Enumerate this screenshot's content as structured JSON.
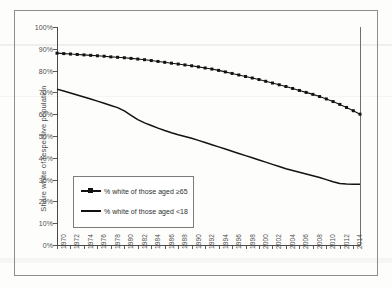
{
  "chart_data": {
    "type": "line",
    "title": "",
    "xlabel": "",
    "ylabel": "Share white of respective population",
    "ylim": [
      0,
      100
    ],
    "xlim": [
      1970,
      2015
    ],
    "y_tick_labels": [
      "0%",
      "10%",
      "20%",
      "30%",
      "40%",
      "50%",
      "60%",
      "70%",
      "80%",
      "90%",
      "100%"
    ],
    "y_tick_values": [
      0,
      10,
      20,
      30,
      40,
      50,
      60,
      70,
      80,
      90,
      100
    ],
    "x_tick_labels": [
      "1970",
      "1972",
      "1974",
      "1976",
      "1978",
      "1980",
      "1982",
      "1984",
      "1986",
      "1988",
      "1990",
      "1992",
      "1994",
      "1996",
      "1998",
      "2000",
      "2002",
      "2004",
      "2006",
      "2008",
      "2010",
      "2012",
      "2014"
    ],
    "x_tick_values": [
      1970,
      1972,
      1974,
      1976,
      1978,
      1980,
      1982,
      1984,
      1986,
      1988,
      1990,
      1992,
      1994,
      1996,
      1998,
      2000,
      2002,
      2004,
      2006,
      2008,
      2010,
      2012,
      2014
    ],
    "grid": false,
    "legend_position": "inside lower-left",
    "x": [
      1970,
      1971,
      1972,
      1973,
      1974,
      1975,
      1976,
      1977,
      1978,
      1979,
      1980,
      1981,
      1982,
      1983,
      1984,
      1985,
      1986,
      1987,
      1988,
      1989,
      1990,
      1991,
      1992,
      1993,
      1994,
      1995,
      1996,
      1997,
      1998,
      1999,
      2000,
      2001,
      2002,
      2003,
      2004,
      2005,
      2006,
      2007,
      2008,
      2009,
      2010,
      2011,
      2012,
      2013,
      2014,
      2015
    ],
    "series": [
      {
        "name": "% white of those aged ≥65",
        "marker": "square",
        "values": [
          88.0,
          87.8,
          87.6,
          87.4,
          87.2,
          87.0,
          86.8,
          86.6,
          86.3,
          86.1,
          85.9,
          85.6,
          85.3,
          85.0,
          84.6,
          84.2,
          83.8,
          83.4,
          83.0,
          82.6,
          82.2,
          81.7,
          81.2,
          80.7,
          80.1,
          79.4,
          78.7,
          78.0,
          77.3,
          76.6,
          75.9,
          75.1,
          74.3,
          73.5,
          72.7,
          71.8,
          70.9,
          70.0,
          69.1,
          68.1,
          67.0,
          65.8,
          64.5,
          63.1,
          61.6,
          60.0
        ]
      },
      {
        "name": "% white of those aged <18",
        "marker": "none",
        "values": [
          71.5,
          70.6,
          69.7,
          68.8,
          67.9,
          67.0,
          66.0,
          65.0,
          64.0,
          63.0,
          61.5,
          59.5,
          57.5,
          56.0,
          54.8,
          53.6,
          52.5,
          51.5,
          50.6,
          49.8,
          49.0,
          48.0,
          47.0,
          46.0,
          45.0,
          44.0,
          43.0,
          42.0,
          41.0,
          40.0,
          39.0,
          38.0,
          37.0,
          36.0,
          35.0,
          34.2,
          33.4,
          32.6,
          31.8,
          31.0,
          30.0,
          29.0,
          28.2,
          28.0,
          27.9,
          27.9
        ]
      }
    ]
  },
  "legend": {
    "items": [
      {
        "label": "% white of those aged ≥65",
        "marker": "line-with-square-marker"
      },
      {
        "label": "% white of those aged <18",
        "marker": "plain-line"
      }
    ]
  },
  "colors": {
    "series_line": "#121212",
    "axis": "#4a4a4a",
    "frame": "#8d8d8d",
    "tick_text": "#4f4f4f",
    "background": "#fdfdfc"
  }
}
